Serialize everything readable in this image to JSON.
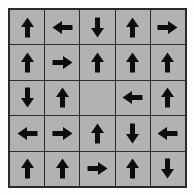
{
  "figure": {
    "name": "arrow-direction-grid",
    "rows": 5,
    "columns": 5,
    "colors": {
      "page_background": "#ffffff",
      "cell_background": "#b2b2b2",
      "grid_line": "#2b2b2b",
      "arrow": "#0d0d0d"
    }
  },
  "grid": {
    "cells": [
      {
        "row": 1,
        "col": 1,
        "direction": "up",
        "icon": "arrow-up-icon",
        "label": "up"
      },
      {
        "row": 1,
        "col": 2,
        "direction": "left",
        "icon": "arrow-left-icon",
        "label": "left"
      },
      {
        "row": 1,
        "col": 3,
        "direction": "down",
        "icon": "arrow-down-icon",
        "label": "down"
      },
      {
        "row": 1,
        "col": 4,
        "direction": "up",
        "icon": "arrow-up-icon",
        "label": "up"
      },
      {
        "row": 1,
        "col": 5,
        "direction": "right",
        "icon": "arrow-right-icon",
        "label": "right"
      },
      {
        "row": 2,
        "col": 1,
        "direction": "up",
        "icon": "arrow-up-icon",
        "label": "up"
      },
      {
        "row": 2,
        "col": 2,
        "direction": "right",
        "icon": "arrow-right-icon",
        "label": "right"
      },
      {
        "row": 2,
        "col": 3,
        "direction": "up",
        "icon": "arrow-up-icon",
        "label": "up"
      },
      {
        "row": 2,
        "col": 4,
        "direction": "up",
        "icon": "arrow-up-icon",
        "label": "up"
      },
      {
        "row": 2,
        "col": 5,
        "direction": "up",
        "icon": "arrow-up-icon",
        "label": "up"
      },
      {
        "row": 3,
        "col": 1,
        "direction": "down",
        "icon": "arrow-down-icon",
        "label": "down"
      },
      {
        "row": 3,
        "col": 2,
        "direction": "up",
        "icon": "arrow-up-icon",
        "label": "up"
      },
      {
        "row": 3,
        "col": 3,
        "direction": "none",
        "icon": "",
        "label": "empty"
      },
      {
        "row": 3,
        "col": 4,
        "direction": "left",
        "icon": "arrow-left-icon",
        "label": "left"
      },
      {
        "row": 3,
        "col": 5,
        "direction": "up",
        "icon": "arrow-up-icon",
        "label": "up"
      },
      {
        "row": 4,
        "col": 1,
        "direction": "left",
        "icon": "arrow-left-icon",
        "label": "left"
      },
      {
        "row": 4,
        "col": 2,
        "direction": "right",
        "icon": "arrow-right-icon",
        "label": "right"
      },
      {
        "row": 4,
        "col": 3,
        "direction": "up",
        "icon": "arrow-up-icon",
        "label": "up"
      },
      {
        "row": 4,
        "col": 4,
        "direction": "down",
        "icon": "arrow-down-icon",
        "label": "down"
      },
      {
        "row": 4,
        "col": 5,
        "direction": "left",
        "icon": "arrow-left-icon",
        "label": "left"
      },
      {
        "row": 5,
        "col": 1,
        "direction": "up",
        "icon": "arrow-up-icon",
        "label": "up"
      },
      {
        "row": 5,
        "col": 2,
        "direction": "up",
        "icon": "arrow-up-icon",
        "label": "up"
      },
      {
        "row": 5,
        "col": 3,
        "direction": "right",
        "icon": "arrow-right-icon",
        "label": "right"
      },
      {
        "row": 5,
        "col": 4,
        "direction": "up",
        "icon": "arrow-up-icon",
        "label": "up"
      },
      {
        "row": 5,
        "col": 5,
        "direction": "down",
        "icon": "arrow-down-icon",
        "label": "down"
      }
    ]
  }
}
